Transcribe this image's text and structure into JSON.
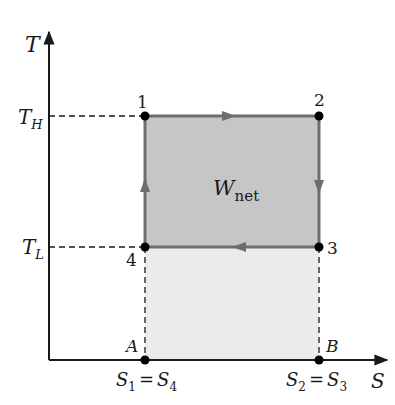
{
  "diagram": {
    "type": "T-S diagram (Carnot cycle)",
    "axes": {
      "y_label": "T",
      "x_label": "S"
    },
    "levels": {
      "T_high": {
        "main": "T",
        "sub": "H"
      },
      "T_low": {
        "main": "T",
        "sub": "L"
      }
    },
    "entropy_ticks": {
      "left": {
        "a": "S",
        "a_sub": "1",
        "eq": "=",
        "b": "S",
        "b_sub": "4"
      },
      "right": {
        "a": "S",
        "a_sub": "2",
        "eq": "=",
        "b": "S",
        "b_sub": "3"
      }
    },
    "points": [
      {
        "label": "1",
        "x": 145,
        "y": 116
      },
      {
        "label": "2",
        "x": 319,
        "y": 116
      },
      {
        "label": "3",
        "x": 319,
        "y": 247
      },
      {
        "label": "4",
        "x": 145,
        "y": 247
      }
    ],
    "base_points": [
      {
        "label": "A",
        "x": 145,
        "y": 360
      },
      {
        "label": "B",
        "x": 319,
        "y": 360
      }
    ],
    "work_label": {
      "main": "W",
      "sub": "net"
    },
    "colors": {
      "work_area": "#c6c6c6",
      "heat_reject_area": "#ebebeb",
      "cycle_line": "#6e6e6e",
      "axis": "#1a1a1a"
    }
  }
}
